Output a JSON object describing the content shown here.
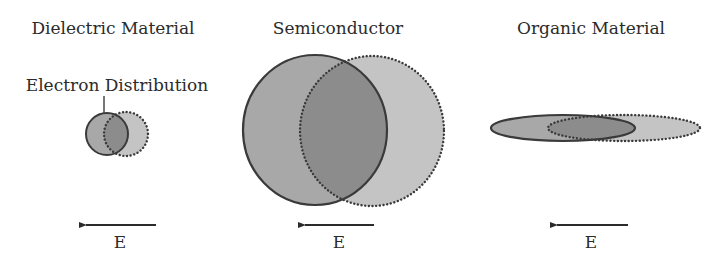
{
  "panels": [
    {
      "title": "Dielectric Material",
      "annotation": "Electron Distribution",
      "field_label": "E",
      "shape": "circle",
      "solid": {
        "cx": 107,
        "cy": 134,
        "rx": 21,
        "ry": 21
      },
      "dotted": {
        "cx": 126,
        "cy": 134,
        "rx": 22,
        "ry": 22
      },
      "arrow": {
        "x1": 156,
        "x2": 84,
        "y": 225
      }
    },
    {
      "title": "Semiconductor",
      "field_label": "E",
      "shape": "circle",
      "solid": {
        "cx": 315,
        "cy": 130,
        "rx": 72,
        "ry": 75
      },
      "dotted": {
        "cx": 372,
        "cy": 131,
        "rx": 72,
        "ry": 75
      },
      "arrow": {
        "x1": 374,
        "x2": 303,
        "y": 225
      }
    },
    {
      "title": "Organic Material",
      "field_label": "E",
      "shape": "ellipse",
      "solid": {
        "cx": 563,
        "cy": 128,
        "rx": 72,
        "ry": 13
      },
      "dotted": {
        "cx": 624,
        "cy": 128,
        "rx": 76,
        "ry": 13
      },
      "arrow": {
        "x1": 628,
        "x2": 555,
        "y": 225
      }
    }
  ],
  "colors": {
    "solid_fill": "#a8a8a8",
    "dotted_fill": "#c4c4c4",
    "overlap_fill": "#8c8c8c",
    "stroke": "#3a3a3a",
    "text": "#2b2b2b"
  }
}
